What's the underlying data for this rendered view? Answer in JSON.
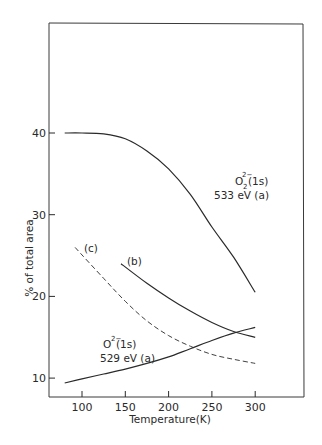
{
  "chart_data": {
    "type": "line",
    "title": "",
    "xlabel": "Temperature(K)",
    "ylabel": "% of total area",
    "xlim": [
      55,
      355
    ],
    "ylim": [
      8,
      49
    ],
    "xticks": [
      100,
      150,
      200,
      250,
      300
    ],
    "xtick_labels": [
      "100",
      "150",
      "200",
      "250",
      "300"
    ],
    "yticks": [
      10,
      20,
      30,
      40
    ],
    "ytick_labels": [
      "10",
      "20",
      "30",
      "40"
    ],
    "grid": false,
    "legend": "none (curves annotated inline)",
    "series": [
      {
        "name": "O2 2- (1s) 533 eV (a)",
        "style": "solid",
        "x": [
          80,
          100,
          125,
          150,
          175,
          200,
          225,
          250,
          275,
          300
        ],
        "y": [
          40.0,
          40.0,
          39.9,
          39.3,
          37.8,
          35.6,
          32.5,
          28.5,
          24.8,
          20.5
        ]
      },
      {
        "name": "(b)",
        "style": "solid",
        "x": [
          145,
          175,
          200,
          225,
          250,
          275,
          300
        ],
        "y": [
          24.0,
          21.6,
          19.8,
          18.2,
          16.8,
          15.7,
          15.0
        ]
      },
      {
        "name": "(c)",
        "style": "dashed",
        "x": [
          92,
          125,
          150,
          175,
          200,
          225,
          250,
          275,
          300
        ],
        "y": [
          26.0,
          22.2,
          19.4,
          17.0,
          15.2,
          13.9,
          12.9,
          12.3,
          11.8
        ]
      },
      {
        "name": "O 2- (1s) 529 eV (a)",
        "style": "solid",
        "x": [
          80,
          100,
          125,
          150,
          175,
          200,
          225,
          250,
          275,
          300
        ],
        "y": [
          9.4,
          9.9,
          10.5,
          11.1,
          11.8,
          12.6,
          13.6,
          14.6,
          15.5,
          16.2
        ]
      }
    ],
    "annotations": [
      {
        "text": "O2 2-(1s)",
        "line2": "533 eV (a)",
        "near": "upper solid curve at ~260 K"
      },
      {
        "text": "(b)",
        "near": "start of curve b at ~150 K"
      },
      {
        "text": "(c)",
        "near": "start of dashed curve c at ~95 K"
      },
      {
        "text": "O 2-(1s)",
        "line2": "529 eV (a)",
        "near": "lower solid curve at ~150 K"
      }
    ]
  },
  "labels": {
    "x_axis_title": "Temperature(K)",
    "y_axis_title": "% of total area",
    "label_533_species": "O",
    "label_533_sub": "2",
    "label_533_sup": "2−",
    "label_533_orbital": "(1s)",
    "label_533_energy": "533 eV (a)",
    "label_529_species": "O",
    "label_529_sup": "2−",
    "label_529_orbital": "(1s)",
    "label_529_energy": "529 eV (a)",
    "label_b": "(b)",
    "label_c": "(c)"
  },
  "colors": {
    "ink": "#2a2a2a",
    "background": "#ffffff"
  }
}
